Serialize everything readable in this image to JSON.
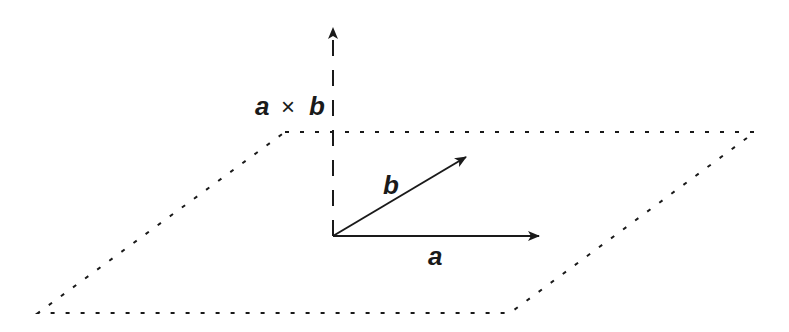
{
  "diagram": {
    "colors": {
      "stroke": "#1a1a1a",
      "background": "#ffffff"
    },
    "plane": {
      "style": "dotted",
      "corners": {
        "top_left": [
          285,
          132
        ],
        "top_right": [
          755,
          132
        ],
        "bottom_right": [
          510,
          313
        ],
        "bottom_left": [
          38,
          313
        ]
      }
    },
    "origin": [
      333,
      236
    ],
    "vectors": [
      {
        "name": "a",
        "label": "a",
        "from": [
          333,
          236
        ],
        "to": [
          540,
          236
        ],
        "style": "solid"
      },
      {
        "name": "b",
        "label": "b",
        "from": [
          333,
          236
        ],
        "to": [
          468,
          156
        ],
        "style": "solid"
      },
      {
        "name": "a_cross_b",
        "label_left": "a",
        "label_op": "×",
        "label_right": "b",
        "from": [
          333,
          236
        ],
        "to": [
          333,
          26
        ],
        "style": "dashed"
      }
    ],
    "labels": {
      "a": "a",
      "b": "b",
      "cross_a": "a",
      "cross_op": "×",
      "cross_b": "b"
    }
  }
}
